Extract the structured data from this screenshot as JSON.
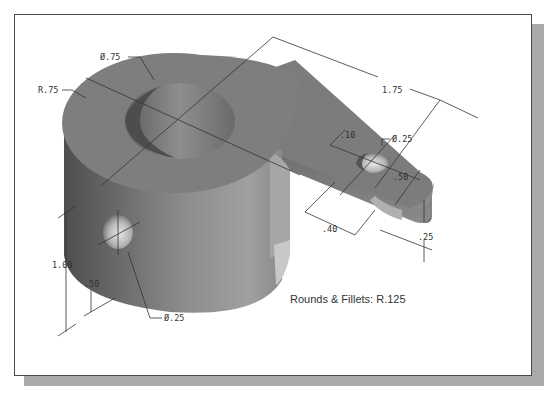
{
  "caption": {
    "text": ""
  },
  "figure": {
    "dimensions": {
      "bore_diameter": "Ø.75",
      "outer_radius": "R.75",
      "arm_length": "1.75",
      "small_hole_diameter": "Ø.25",
      "small_hole_offset": ".10",
      "arm_width": ".50",
      "fillet_offset": ".40",
      "arm_thickness": ".25",
      "cylinder_height": "1.00",
      "side_hole_height": ".50",
      "side_hole_diameter": "Ø.25"
    },
    "note": "Rounds & Fillets: R.125"
  },
  "colors": {
    "part_top": "#7a7a7a",
    "part_side_dark": "#5a5a5a",
    "part_side_light": "#9a9a9a",
    "frame_border": "#4a4a4a",
    "shadow": "#a9a9a9",
    "dimension_line": "#333333"
  }
}
